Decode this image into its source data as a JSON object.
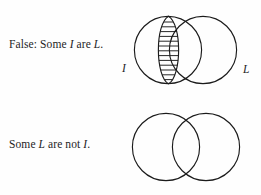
{
  "figure": {
    "background_color": "#fefefe",
    "stroke_color": "#1b1b1b",
    "text_color": "#1d1d1f",
    "panels": [
      {
        "id": "top",
        "caption_prefix": "False: Some ",
        "caption_term_1": "I",
        "caption_middle": " are ",
        "caption_term_2": "L",
        "caption_suffix": ".",
        "caption_full": "False: Some I are L.",
        "diagram": {
          "type": "venn-two-circle",
          "left_circle_label": "I",
          "right_circle_label": "L",
          "shading": "intersection",
          "shading_style": "horizontal-hatch",
          "hatch_line_count": 13,
          "x_marker": null
        }
      },
      {
        "id": "bottom",
        "caption_prefix": "Some ",
        "caption_term_1": "L",
        "caption_middle": " are not ",
        "caption_term_2": "I",
        "caption_suffix": ".",
        "caption_full": "Some L are not I.",
        "diagram": {
          "type": "venn-two-circle",
          "left_circle_label": "I",
          "right_circle_label": "L",
          "shading": "none",
          "shading_style": null,
          "hatch_line_count": 0,
          "x_marker": "X"
        }
      }
    ]
  }
}
